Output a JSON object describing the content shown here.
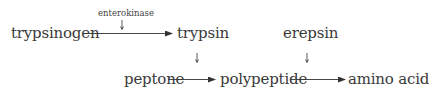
{
  "diagram": {
    "nodes": {
      "trypsinogen": "trypsinogen",
      "trypsin": "trypsin",
      "erepsin": "erepsin",
      "peptone": "peptone",
      "polypeptide": "polypeptide",
      "amino_acid": "amino acid"
    },
    "catalysts": {
      "enterokinase": "enterokinase"
    },
    "edges": [
      {
        "from": "trypsinogen",
        "to": "trypsin",
        "catalyst": "enterokinase"
      },
      {
        "from": "peptone",
        "to": "polypeptide",
        "catalyst": "trypsin"
      },
      {
        "from": "polypeptide",
        "to": "amino acid",
        "catalyst": "erepsin"
      }
    ],
    "colors": {
      "text": "#3a3a3a",
      "arrow": "#333333",
      "background": "#ffffff"
    }
  }
}
